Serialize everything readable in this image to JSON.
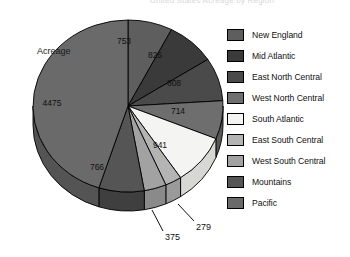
{
  "title": "United States Acreage by Region",
  "axis_note": "Acreage",
  "chart_data": {
    "type": "pie",
    "title": "United States Acreage by Region",
    "value_label": "Acreage",
    "total": 9936,
    "start_angle_deg": 0,
    "direction": "clockwise",
    "three_d": true,
    "legend_position": "right",
    "categories": [
      "New England",
      "Mid Atlantic",
      "East North Central",
      "West North Central",
      "South Atlantic",
      "East South Central",
      "West South Central",
      "Mountains",
      "Pacific"
    ],
    "values": [
      753,
      825,
      808,
      714,
      941,
      279,
      375,
      766,
      4475
    ],
    "colors": [
      "#5e5e5e",
      "#3a3a3a",
      "#4a4a4a",
      "#6e6e6e",
      "#f4f4f2",
      "#b4b4b4",
      "#a2a2a2",
      "#555555",
      "#6a6a6a"
    ],
    "slices": [
      {
        "label": "New England",
        "value": 753,
        "value_text": "753",
        "color": "#5e5e5e",
        "side_color": "#4b4b4b",
        "label_x": 124,
        "label_y": 44,
        "leader": false
      },
      {
        "label": "Mid Atlantic",
        "value": 825,
        "value_text": "825",
        "color": "#3a3a3a",
        "side_color": "#2c2c2c",
        "label_x": 155,
        "label_y": 58,
        "leader": false
      },
      {
        "label": "East North Central",
        "value": 808,
        "value_text": "808",
        "color": "#4a4a4a",
        "side_color": "#3a3a3a",
        "label_x": 174,
        "label_y": 86,
        "leader": false
      },
      {
        "label": "West North Central",
        "value": 714,
        "value_text": "714",
        "color": "#6e6e6e",
        "side_color": "#585858",
        "label_x": 178,
        "label_y": 114,
        "leader": false
      },
      {
        "label": "South Atlantic",
        "value": 941,
        "value_text": "941",
        "color": "#f4f4f2",
        "side_color": "#d7d7d4",
        "label_x": 160,
        "label_y": 148,
        "leader": false
      },
      {
        "label": "East South Central",
        "value": 279,
        "value_text": "279",
        "color": "#b4b4b4",
        "side_color": "#9a9a9a",
        "label_x": 196,
        "label_y": 222,
        "leader": true
      },
      {
        "label": "West South Central",
        "value": 375,
        "value_text": "375",
        "color": "#a2a2a2",
        "side_color": "#8a8a8a",
        "label_x": 165,
        "label_y": 232,
        "leader": true
      },
      {
        "label": "Mountains",
        "value": 766,
        "value_text": "766",
        "color": "#555555",
        "side_color": "#3f3f3f",
        "label_x": 97,
        "label_y": 170,
        "leader": false
      },
      {
        "label": "Pacific",
        "value": 4475,
        "value_text": "4475",
        "color": "#6a6a6a",
        "side_color": "#545454",
        "label_x": 52,
        "label_y": 106,
        "leader": false
      }
    ]
  },
  "legend": {
    "items": [
      {
        "label": "New England",
        "color": "#5e5e5e"
      },
      {
        "label": "Mid Atlantic",
        "color": "#3a3a3a"
      },
      {
        "label": "East North Central",
        "color": "#4a4a4a"
      },
      {
        "label": "West North Central",
        "color": "#6e6e6e"
      },
      {
        "label": "South Atlantic",
        "color": "#f4f4f2"
      },
      {
        "label": "East South Central",
        "color": "#b4b4b4"
      },
      {
        "label": "West South Central",
        "color": "#a2a2a2"
      },
      {
        "label": "Mountains",
        "color": "#555555"
      },
      {
        "label": "Pacific",
        "color": "#6a6a6a"
      }
    ]
  },
  "callouts": [
    {
      "text": "375"
    },
    {
      "text": "279"
    }
  ]
}
